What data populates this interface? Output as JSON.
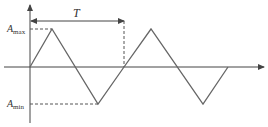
{
  "diagram": {
    "type": "triangle-wave",
    "labels": {
      "period": "T",
      "amax_main": "A",
      "amax_sub": "max",
      "amin_main": "A",
      "amin_sub": "min"
    },
    "colors": {
      "stroke": "#555555",
      "text": "#333333",
      "background": "#ffffff"
    }
  }
}
